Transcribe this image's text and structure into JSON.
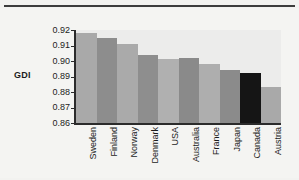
{
  "chart_data": {
    "type": "bar",
    "title": "",
    "xlabel": "",
    "ylabel": "GDI",
    "ylim": [
      0.86,
      0.92
    ],
    "yticks": [
      "0.92",
      "0.91",
      "0.90",
      "0.89",
      "0.88",
      "0.87",
      "0.86"
    ],
    "grid": false,
    "legend": "none",
    "categories": [
      "Sweden",
      "Finland",
      "Norway",
      "Denmark",
      "USA",
      "Australia",
      "France",
      "Japan",
      "Canada",
      "Austria"
    ],
    "values": [
      0.918,
      0.915,
      0.911,
      0.904,
      0.901,
      0.902,
      0.898,
      0.894,
      0.892,
      0.883
    ],
    "bar_colors": [
      "#a9a9a9",
      "#8d8d8d",
      "#aaaaaa",
      "#8e8e8e",
      "#b0b0b0",
      "#8a8a8a",
      "#aeaeae",
      "#8b8b8b",
      "#151515",
      "#a9a9a9"
    ],
    "highlight_category": "Canada",
    "highlight_color": "#151515"
  },
  "axis": {
    "y_title": "GDI"
  },
  "figure": {
    "background": "#f2f2f0",
    "plot_background": "#ececeb",
    "axis_color": "#2b2b2b",
    "rule_color": "#3c3c3c"
  }
}
